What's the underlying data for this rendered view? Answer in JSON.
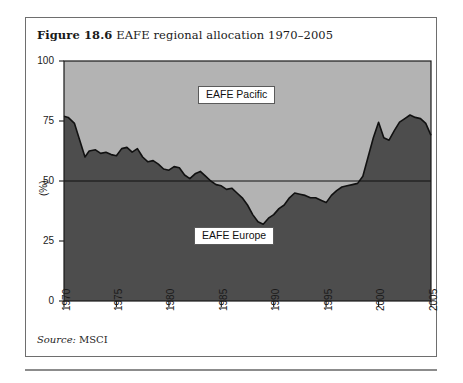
{
  "figure": {
    "number": "Figure 18.6",
    "caption": "EAFE regional allocation 1970–2005",
    "source_label": "Source:",
    "source_value": "MSCI"
  },
  "colors": {
    "pacific_fill": "#b3b3b3",
    "europe_fill": "#4d4d4d",
    "line": "#111111",
    "axis": "#1a1a1a",
    "frame": "#6e6e6e",
    "label_box_bg": "#ffffff"
  },
  "chart_data": {
    "type": "area",
    "title": "EAFE regional allocation 1970–2005",
    "xlabel": "",
    "ylabel": "(%)",
    "xlim": [
      1970,
      2005
    ],
    "ylim": [
      0,
      100
    ],
    "yticks": [
      0,
      25,
      50,
      75,
      100
    ],
    "xticks": [
      1970,
      1975,
      1980,
      1985,
      1990,
      1995,
      2000,
      2005
    ],
    "grid": false,
    "legend_position": "inside-annotations",
    "stacked": true,
    "reference_line": 50,
    "annotations": [
      {
        "text": "EAFE Pacific",
        "x": 1982.5,
        "y": 84
      },
      {
        "text": "EAFE Europe",
        "x": 1982.0,
        "y": 27
      }
    ],
    "series": [
      {
        "name": "EAFE Europe",
        "fill": "#4d4d4d",
        "x": [
          1970,
          1971,
          1972,
          1973,
          1974,
          1975,
          1976,
          1977,
          1978,
          1979,
          1980,
          1981,
          1982,
          1983,
          1984,
          1985,
          1986,
          1987,
          1988,
          1989,
          1990,
          1991,
          1992,
          1993,
          1994,
          1995,
          1996,
          1997,
          1998,
          1999,
          2000,
          2001,
          2002,
          2003,
          2004,
          2005
        ],
        "values": [
          77,
          76,
          60,
          63,
          62,
          61,
          64,
          63,
          58,
          57,
          55,
          56,
          51,
          54,
          50,
          48,
          47,
          43,
          36,
          32,
          36,
          40,
          45,
          44,
          43,
          41,
          46,
          48,
          49,
          48,
          58,
          68,
          75,
          67,
          71,
          76
        ]
      },
      {
        "name": "EAFE Pacific",
        "fill": "#b3b3b3",
        "x": [
          1970,
          1971,
          1972,
          1973,
          1974,
          1975,
          1976,
          1977,
          1978,
          1979,
          1980,
          1981,
          1982,
          1983,
          1984,
          1985,
          1986,
          1987,
          1988,
          1989,
          1990,
          1991,
          1992,
          1993,
          1994,
          1995,
          1996,
          1997,
          1998,
          1999,
          2000,
          2001,
          2002,
          2003,
          2004,
          2005
        ],
        "values": [
          23,
          24,
          40,
          37,
          38,
          39,
          36,
          37,
          42,
          43,
          45,
          44,
          49,
          46,
          50,
          52,
          53,
          57,
          64,
          68,
          64,
          60,
          55,
          56,
          57,
          59,
          54,
          52,
          51,
          52,
          42,
          32,
          25,
          33,
          29,
          24
        ]
      }
    ],
    "europe_share_detailed": {
      "x": [
        1970.0,
        1970.4,
        1971.0,
        1971.5,
        1972.0,
        1972.4,
        1973.0,
        1973.5,
        1974.0,
        1974.5,
        1975.0,
        1975.5,
        1976.0,
        1976.5,
        1977.0,
        1977.5,
        1978.0,
        1978.5,
        1979.0,
        1979.5,
        1980.0,
        1980.5,
        1981.0,
        1981.5,
        1982.0,
        1982.5,
        1983.0,
        1983.5,
        1984.0,
        1984.5,
        1985.0,
        1985.5,
        1986.0,
        1986.5,
        1987.0,
        1987.5,
        1988.0,
        1988.5,
        1989.0,
        1989.5,
        1990.0,
        1990.5,
        1991.0,
        1991.5,
        1992.0,
        1992.5,
        1993.0,
        1993.5,
        1994.0,
        1994.5,
        1995.0,
        1995.5,
        1996.0,
        1996.5,
        1997.0,
        1997.5,
        1998.0,
        1998.5,
        1999.0,
        1999.5,
        2000.0,
        2000.5,
        2001.0,
        2001.5,
        2002.0,
        2002.5,
        2003.0,
        2003.5,
        2004.0,
        2004.5,
        2005.0
      ],
      "y": [
        77.0,
        76.5,
        74.0,
        67.0,
        60.0,
        62.5,
        63.0,
        61.5,
        62.0,
        61.0,
        60.5,
        63.5,
        64.0,
        62.0,
        63.5,
        60.0,
        58.0,
        58.5,
        57.0,
        55.0,
        54.5,
        56.0,
        55.5,
        52.5,
        51.0,
        53.0,
        54.0,
        52.0,
        50.0,
        48.5,
        48.0,
        46.5,
        47.0,
        45.0,
        43.0,
        40.0,
        36.0,
        33.0,
        32.0,
        34.5,
        36.0,
        38.5,
        40.0,
        43.0,
        45.0,
        44.5,
        44.0,
        43.0,
        43.0,
        42.0,
        41.0,
        44.0,
        46.0,
        47.5,
        48.0,
        48.5,
        49.0,
        52.0,
        60.0,
        68.0,
        74.5,
        68.0,
        67.0,
        71.0,
        74.5,
        76.0,
        77.5,
        76.5,
        76.0,
        74.0,
        69.0
      ]
    }
  },
  "axis": {
    "y_title": "(%)",
    "y_tick_labels": [
      "100",
      "75",
      "50",
      "25",
      "0"
    ],
    "x_tick_labels": [
      "1970",
      "1975",
      "1980",
      "1985",
      "1990",
      "1995",
      "2000",
      "2005"
    ]
  },
  "annotations": {
    "pacific": "EAFE Pacific",
    "europe": "EAFE Europe"
  }
}
